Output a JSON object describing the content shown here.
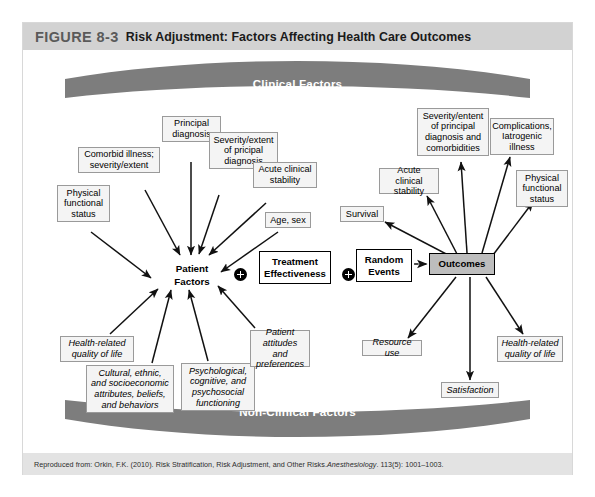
{
  "figure": {
    "number": "FIGURE 8-3",
    "title": "Risk Adjustment: Factors Affecting Health Care Outcomes"
  },
  "banners": {
    "top": "Clinical Factors",
    "bottom": "Non-Clinical Factors"
  },
  "nodes": {
    "patient_factors_line1": "Patient",
    "patient_factors_line2": "Factors",
    "treatment_effectiveness": "Treatment Effectiveness",
    "random_events": "Random Events",
    "outcomes": "Outcomes",
    "plus_symbol": "+"
  },
  "clinical_inputs": [
    {
      "id": "principal-diagnosis",
      "text": "Principal diagnosis"
    },
    {
      "id": "severity-extent-principal-diagnosis",
      "text": "Severity/extent of pricipal diagnosis"
    },
    {
      "id": "comorbid-illness",
      "text": "Comorbid illness; severity/extent"
    },
    {
      "id": "acute-clinical-stability",
      "text": "Acute clinical stability"
    },
    {
      "id": "physical-functional-status",
      "text": "Physical functional status"
    },
    {
      "id": "age-sex",
      "text": "Age, sex"
    }
  ],
  "nonclinical_inputs": [
    {
      "id": "health-related-quality-of-life",
      "text": "Health-related quality of life"
    },
    {
      "id": "cultural-ethnic-socioeconomic",
      "text": "Cultural, ethnic, and socioeconomic attributes, beliefs, and behaviors"
    },
    {
      "id": "psychological-cognitive-psychosocial",
      "text": "Psychological, cognitive, and psychosocial functioning"
    },
    {
      "id": "patient-attitudes-preferences",
      "text": "Patient attitudes and preferences"
    }
  ],
  "clinical_outcomes": [
    {
      "id": "severity-extent-diagnosis-comorbidities",
      "text": "Severity/entent of principal diagnosis and comorbidities"
    },
    {
      "id": "complications-iatrogenic-illness",
      "text": "Complications, Iatrogenic illness"
    },
    {
      "id": "acute-clinical-stability-outcome",
      "text": "Acute clinical stability"
    },
    {
      "id": "physical-functional-status-outcome",
      "text": "Physical functional status"
    },
    {
      "id": "survival",
      "text": "Survival"
    }
  ],
  "nonclinical_outcomes": [
    {
      "id": "resource-use",
      "text": "Resource use"
    },
    {
      "id": "health-related-quality-of-life-outcome",
      "text": "Health-related quality of life"
    },
    {
      "id": "satisfaction",
      "text": "Satisfaction"
    }
  ],
  "citation": {
    "prefix": "Reproduced from: Orkin, F.K. (2010). Risk Stratification, Risk Adjustment, and Other Risks. ",
    "journal": "Anesthesiology",
    "suffix": ". 113(5): 1001–1003."
  },
  "colors": {
    "banner_gray": "#7d7d7d",
    "title_bar_gray": "#d2d2d2",
    "outcomes_fill": "#bdbdbd",
    "label_fill": "#f4f4f4",
    "citation_bg": "#e3e3e3"
  }
}
